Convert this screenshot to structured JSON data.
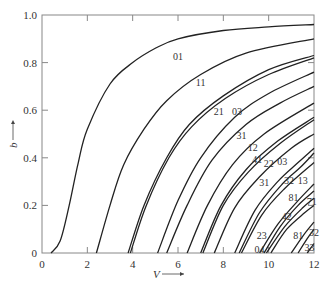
{
  "chart_data": {
    "type": "line",
    "title": "",
    "xlabel": "V",
    "ylabel": "b",
    "xlim": [
      0,
      12
    ],
    "ylim": [
      0,
      1.0
    ],
    "x_ticks": [
      0,
      2,
      4,
      6,
      8,
      10,
      12
    ],
    "y_ticks": [
      0,
      0.2,
      0.4,
      0.6,
      0.8,
      1.0
    ],
    "x_tick_labels": [
      "0",
      "2",
      "4",
      "6",
      "8",
      "10",
      "12"
    ],
    "y_tick_labels": [
      "0",
      "0.2",
      "0.4",
      "0.6",
      "0.8",
      "1.0"
    ],
    "grid": false,
    "legend": "inline curve labels",
    "series": [
      {
        "name": "01",
        "cutoff": 0.4,
        "points": [
          [
            0.4,
            0
          ],
          [
            0.8,
            0.05
          ],
          [
            1.2,
            0.2
          ],
          [
            1.6,
            0.38
          ],
          [
            2,
            0.52
          ],
          [
            3,
            0.71
          ],
          [
            4,
            0.8
          ],
          [
            5,
            0.86
          ],
          [
            6,
            0.9
          ],
          [
            8,
            0.935
          ],
          [
            10,
            0.95
          ],
          [
            12,
            0.96
          ]
        ],
        "label_at": [
          6.0,
          0.81
        ]
      },
      {
        "name": "11",
        "cutoff": 2.4,
        "points": [
          [
            2.4,
            0
          ],
          [
            3,
            0.2
          ],
          [
            3.6,
            0.37
          ],
          [
            4.5,
            0.52
          ],
          [
            5.5,
            0.64
          ],
          [
            7,
            0.75
          ],
          [
            9,
            0.84
          ],
          [
            12,
            0.9
          ]
        ],
        "label_at": [
          7.0,
          0.7
        ]
      },
      {
        "name": "21",
        "cutoff": 3.8,
        "points": [
          [
            3.8,
            0
          ],
          [
            4.5,
            0.2
          ],
          [
            5.5,
            0.4
          ],
          [
            6.5,
            0.54
          ],
          [
            8,
            0.66
          ],
          [
            10,
            0.77
          ],
          [
            12,
            0.83
          ]
        ],
        "label_at": [
          7.8,
          0.58
        ]
      },
      {
        "name": "03",
        "cutoff": 3.9,
        "points": [
          [
            3.9,
            0
          ],
          [
            4.6,
            0.2
          ],
          [
            5.6,
            0.4
          ],
          [
            6.6,
            0.53
          ],
          [
            8.1,
            0.65
          ],
          [
            10,
            0.75
          ],
          [
            12,
            0.82
          ]
        ],
        "label_at": [
          8.6,
          0.58
        ]
      },
      {
        "name": "31",
        "cutoff": 5.1,
        "points": [
          [
            5.1,
            0
          ],
          [
            6,
            0.22
          ],
          [
            7,
            0.4
          ],
          [
            8.5,
            0.57
          ],
          [
            10,
            0.67
          ],
          [
            12,
            0.76
          ]
        ],
        "label_at": [
          8.8,
          0.48
        ]
      },
      {
        "name": "12",
        "cutoff": 5.5,
        "points": [
          [
            5.5,
            0
          ],
          [
            6.4,
            0.2
          ],
          [
            7.5,
            0.39
          ],
          [
            9,
            0.54
          ],
          [
            10.5,
            0.63
          ],
          [
            12,
            0.7
          ]
        ],
        "label_at": [
          9.3,
          0.43
        ]
      },
      {
        "name": "41",
        "cutoff": 6.4,
        "points": [
          [
            6.4,
            0
          ],
          [
            7.3,
            0.2
          ],
          [
            8.4,
            0.37
          ],
          [
            9.8,
            0.5
          ],
          [
            12,
            0.63
          ]
        ],
        "label_at": [
          9.5,
          0.38
        ]
      },
      {
        "name": "22",
        "cutoff": 7.0,
        "points": [
          [
            7,
            0
          ],
          [
            7.9,
            0.2
          ],
          [
            9,
            0.35
          ],
          [
            10.4,
            0.47
          ],
          [
            12,
            0.57
          ]
        ],
        "label_at": [
          10.0,
          0.36
        ]
      },
      {
        "name": "03",
        "cutoff": 7.1,
        "points": [
          [
            7.1,
            0
          ],
          [
            8,
            0.2
          ],
          [
            9.1,
            0.34
          ],
          [
            10.5,
            0.46
          ],
          [
            12,
            0.56
          ]
        ],
        "label_at": [
          10.6,
          0.37
        ]
      },
      {
        "name": "31",
        "cutoff": 7.6,
        "points": [
          [
            7.6,
            0
          ],
          [
            8.5,
            0.19
          ],
          [
            9.6,
            0.32
          ],
          [
            11,
            0.44
          ],
          [
            12,
            0.5
          ]
        ],
        "label_at": [
          9.8,
          0.28
        ]
      },
      {
        "name": "32",
        "cutoff": 8.5,
        "points": [
          [
            8.5,
            0
          ],
          [
            9.4,
            0.18
          ],
          [
            10.4,
            0.3
          ],
          [
            11.3,
            0.38
          ],
          [
            12,
            0.44
          ]
        ],
        "label_at": [
          10.9,
          0.29
        ]
      },
      {
        "name": "13",
        "cutoff": 8.7,
        "points": [
          [
            8.7,
            0
          ],
          [
            9.6,
            0.17
          ],
          [
            10.6,
            0.29
          ],
          [
            11.4,
            0.36
          ],
          [
            12,
            0.42
          ]
        ],
        "label_at": [
          11.5,
          0.29
        ]
      },
      {
        "name": "81",
        "cutoff": 8.8,
        "points": [
          [
            8.8,
            0
          ],
          [
            9.7,
            0.16
          ],
          [
            10.7,
            0.27
          ],
          [
            12,
            0.38
          ]
        ],
        "label_at": [
          11.1,
          0.22
        ]
      },
      {
        "name": "71",
        "cutoff": 9.6,
        "points": [
          [
            9.6,
            0
          ],
          [
            10.4,
            0.12
          ],
          [
            11.3,
            0.22
          ],
          [
            12,
            0.29
          ]
        ],
        "label_at": [
          11.9,
          0.2
        ]
      },
      {
        "name": "42",
        "cutoff": 9.8,
        "points": [
          [
            9.8,
            0
          ],
          [
            10.5,
            0.11
          ],
          [
            11.3,
            0.2
          ],
          [
            12,
            0.26
          ]
        ],
        "label_at": [
          10.8,
          0.14
        ]
      },
      {
        "name": "23",
        "cutoff": 9.9,
        "points": [
          [
            9.9,
            0
          ],
          [
            10.7,
            0.11
          ],
          [
            11.5,
            0.19
          ],
          [
            12,
            0.23
          ]
        ],
        "label_at": [
          9.7,
          0.06
        ]
      },
      {
        "name": "04",
        "cutoff": 10.1,
        "points": [
          [
            10.1,
            0
          ],
          [
            10.8,
            0.1
          ],
          [
            11.6,
            0.17
          ],
          [
            12,
            0.2
          ]
        ],
        "label_at": [
          9.6,
          0.0
        ]
      },
      {
        "name": "81",
        "cutoff": 11.0,
        "points": [
          [
            11,
            0
          ],
          [
            11.5,
            0.07
          ],
          [
            12,
            0.13
          ]
        ],
        "label_at": [
          11.3,
          0.06
        ]
      },
      {
        "name": "32",
        "cutoff": 11.3,
        "points": [
          [
            11.3,
            0
          ],
          [
            11.7,
            0.06
          ],
          [
            12,
            0.1
          ]
        ],
        "label_at": [
          12.0,
          0.07
        ]
      },
      {
        "name": "33",
        "cutoff": 11.7,
        "points": [
          [
            11.7,
            0
          ],
          [
            12,
            0.04
          ]
        ],
        "label_at": [
          11.8,
          0.01
        ]
      }
    ]
  },
  "axes": {
    "x_title": "V",
    "y_title": "b",
    "arrow": "⟶"
  }
}
